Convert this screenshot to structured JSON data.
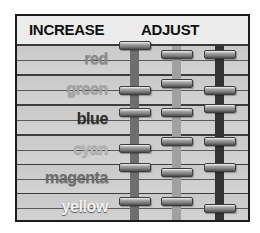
{
  "header": {
    "left_title": "INCREASE",
    "right_title": "ADJUST"
  },
  "rows": [
    {
      "label": "red",
      "color": "#8a8a8a"
    },
    {
      "label": "green",
      "color": "#a4a4a4"
    },
    {
      "label": "blue",
      "color": "#2e2e2e"
    },
    {
      "label": "cyan",
      "color": "#b6b6b6"
    },
    {
      "label": "magenta",
      "color": "#6c6c6c"
    },
    {
      "label": "yellow",
      "color": "#f2f2f2"
    }
  ],
  "sliders": [
    {
      "name": "slider-1",
      "track_color": "#6e6e6e",
      "handles_y": [
        29,
        74,
        96,
        132,
        151,
        185
      ]
    },
    {
      "name": "slider-2",
      "track_color": "#a0a0a0",
      "handles_y": [
        38,
        67,
        96,
        125,
        156,
        185
      ]
    },
    {
      "name": "slider-3",
      "track_color": "#333333",
      "handles_y": [
        38,
        74,
        92,
        125,
        151,
        192
      ]
    }
  ]
}
